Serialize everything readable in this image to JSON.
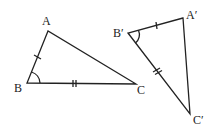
{
  "diagram": {
    "title": "",
    "triangles": [
      {
        "name": "ABC",
        "vertices": {
          "A": {
            "label": "A",
            "x": 48,
            "y": 31,
            "label_x": 42,
            "label_y": 25
          },
          "B": {
            "label": "B",
            "x": 27,
            "y": 83,
            "label_x": 14,
            "label_y": 92
          },
          "C": {
            "label": "C",
            "x": 136,
            "y": 84,
            "label_x": 137,
            "label_y": 94
          }
        },
        "marks": {
          "AB": "single-tick",
          "BC": "double-tick",
          "angle_B": "arc"
        }
      },
      {
        "name": "A'B'C'",
        "vertices": {
          "A": {
            "label": "A′",
            "x": 183,
            "y": 18,
            "label_x": 186,
            "label_y": 19
          },
          "B": {
            "label": "B′",
            "x": 128,
            "y": 33,
            "label_x": 113,
            "label_y": 37
          },
          "C": {
            "label": "C′",
            "x": 190,
            "y": 114,
            "label_x": 193,
            "label_y": 124
          }
        },
        "marks": {
          "A'B'": "single-tick",
          "B'C'": "double-tick",
          "angle_B'": "arc"
        }
      }
    ],
    "stroke_color": "#222222"
  }
}
